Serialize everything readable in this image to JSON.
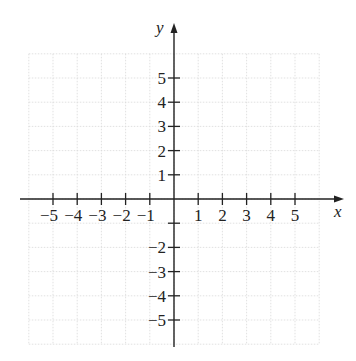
{
  "diagram": {
    "type": "cartesian-coordinate-plane",
    "x_axis": {
      "label": "x",
      "range": [
        -6,
        6
      ],
      "tick_labels": [
        {
          "value": -5,
          "text": "−5"
        },
        {
          "value": -4,
          "text": "−4"
        },
        {
          "value": -3,
          "text": "−3"
        },
        {
          "value": -2,
          "text": "−2"
        },
        {
          "value": -1,
          "text": "−1"
        },
        {
          "value": 1,
          "text": "1"
        },
        {
          "value": 2,
          "text": "2"
        },
        {
          "value": 3,
          "text": "3"
        },
        {
          "value": 4,
          "text": "4"
        },
        {
          "value": 5,
          "text": "5"
        }
      ]
    },
    "y_axis": {
      "label": "y",
      "range": [
        -6,
        6
      ],
      "tick_labels": [
        {
          "value": 5,
          "text": "5"
        },
        {
          "value": 4,
          "text": "4"
        },
        {
          "value": 3,
          "text": "3"
        },
        {
          "value": 2,
          "text": "2"
        },
        {
          "value": 1,
          "text": "1"
        },
        {
          "value": -2,
          "text": "−2"
        },
        {
          "value": -3,
          "text": "−3"
        },
        {
          "value": -4,
          "text": "−4"
        },
        {
          "value": -5,
          "text": "−5"
        }
      ]
    },
    "grid": {
      "visible": true,
      "spacing": 1,
      "color": "#d9d9d9"
    },
    "axis_color": "#222222"
  }
}
